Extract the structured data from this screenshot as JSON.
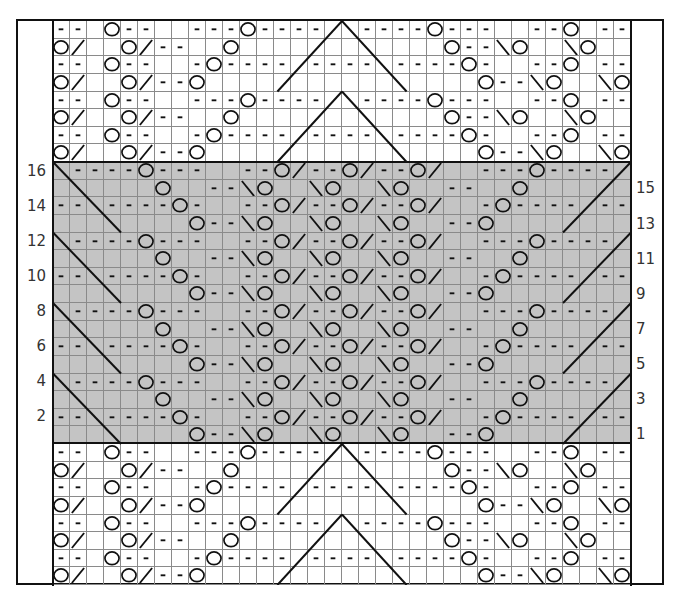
{
  "chart": {
    "type": "knitting-chart",
    "columns": 34,
    "rows": 32,
    "cell_width": 17,
    "cell_height": 17.625,
    "colors": {
      "shaded_repeat": "#c4c4c4",
      "background": "#ffffff",
      "grid_line": "#8a8a8a",
      "ink": "#111111"
    },
    "legend": {
      " ": "knit",
      "-": "purl",
      "O": "yarn-over",
      "/": "k2tog",
      "\\": "ssk"
    },
    "shaded_rows": [
      8,
      23
    ],
    "grid_rows": [
      "-- O--  ---O----  ----O---  --O --",
      "O/  O/--  O            O--\\O  \\O",
      "-- O--  -O---- ---- ----O-  --O --",
      "O/  O/--O                O--\\O  \\O",
      "-- O--  ---O----  ----O---  --O --",
      "O/  O/--  O            O--\\O  \\O",
      "-- O--  -O---- ---- ----O-  --O --",
      "O/  O/--O                O--\\O  \\O",
      " ----O---  --O/--O/--O/  ---O---- ",
      "      O  --\\O  \\O  \\O  --  O      ",
      "-- ----O-  --O/--O/--O/  -O---- --",
      "        O--\\O  \\O  \\O  --O        ",
      " ----O---  --O/--O/--O/  ---O---- ",
      "      O  --\\O  \\O  \\O  --  O      ",
      "-- ----O-  --O/--O/--O/  -O---- --",
      "        O--\\O  \\O  \\O  --O        ",
      " ----O---  --O/--O/--O/  ---O---- ",
      "      O  --\\O  \\O  \\O  --  O      ",
      "-- ----O-  --O/--O/--O/  -O---- --",
      "        O--\\O  \\O  \\O  --O        ",
      " ----O---  --O/--O/--O/  ---O---- ",
      "      O  --\\O  \\O  \\O  --  O      ",
      "-- ----O-  --O/--O/--O/  -O---- --",
      "        O--\\O  \\O  \\O  --O        ",
      "-- O--  ---O----  ----O---  --O --",
      "O/  O/--  O            O--\\O  \\O",
      "-- O--  -O---- ---- ----O-  --O --",
      "O/  O/--O                O--\\O  \\O",
      "-- O--  ---O----  ----O---  --O --",
      "O/  O/--  O            O--\\O  \\O",
      "-- O--  -O---- ---- ----O-  --O --",
      "O/  O/--O                O--\\O  \\O"
    ],
    "long_lines": [
      {
        "x1": 17,
        "y1": 0,
        "x2": 13.2,
        "y2": 4
      },
      {
        "x1": 17,
        "y1": 0,
        "x2": 20.8,
        "y2": 4
      },
      {
        "x1": 17,
        "y1": 4,
        "x2": 13.2,
        "y2": 8
      },
      {
        "x1": 17,
        "y1": 4,
        "x2": 20.8,
        "y2": 8
      },
      {
        "x1": 0,
        "y1": 8,
        "x2": 4,
        "y2": 12
      },
      {
        "x1": 0,
        "y1": 12,
        "x2": 4,
        "y2": 16
      },
      {
        "x1": 0,
        "y1": 16,
        "x2": 4,
        "y2": 20
      },
      {
        "x1": 0,
        "y1": 20,
        "x2": 4,
        "y2": 24
      },
      {
        "x1": 34,
        "y1": 8,
        "x2": 30,
        "y2": 12
      },
      {
        "x1": 34,
        "y1": 12,
        "x2": 30,
        "y2": 16
      },
      {
        "x1": 34,
        "y1": 16,
        "x2": 30,
        "y2": 20
      },
      {
        "x1": 34,
        "y1": 20,
        "x2": 30,
        "y2": 24
      },
      {
        "x1": 17,
        "y1": 24,
        "x2": 13.2,
        "y2": 28
      },
      {
        "x1": 17,
        "y1": 24,
        "x2": 20.8,
        "y2": 28
      },
      {
        "x1": 17,
        "y1": 28,
        "x2": 13.2,
        "y2": 32
      },
      {
        "x1": 17,
        "y1": 28,
        "x2": 20.8,
        "y2": 32
      }
    ]
  },
  "row_labels": {
    "left": [
      {
        "text": "16",
        "y": 171
      },
      {
        "text": "14",
        "y": 206
      },
      {
        "text": "12",
        "y": 241
      },
      {
        "text": "10",
        "y": 276
      },
      {
        "text": "8",
        "y": 311
      },
      {
        "text": "6",
        "y": 346
      },
      {
        "text": "4",
        "y": 381
      },
      {
        "text": "2",
        "y": 416
      }
    ],
    "right": [
      {
        "text": "15",
        "y": 188
      },
      {
        "text": "13",
        "y": 224
      },
      {
        "text": "11",
        "y": 259
      },
      {
        "text": "9",
        "y": 294
      },
      {
        "text": "7",
        "y": 329
      },
      {
        "text": "5",
        "y": 364
      },
      {
        "text": "3",
        "y": 399
      },
      {
        "text": "1",
        "y": 434
      }
    ]
  }
}
